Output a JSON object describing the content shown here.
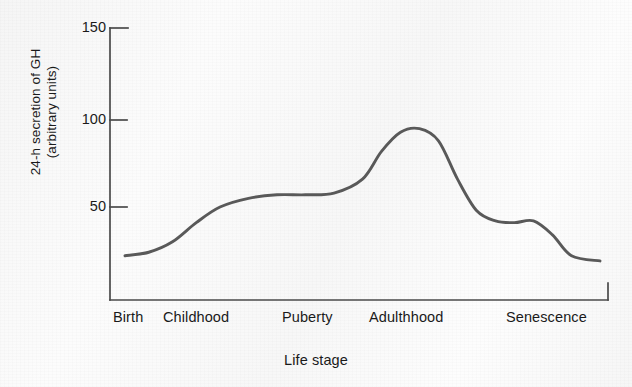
{
  "chart_data": {
    "type": "line",
    "title": "",
    "subtitle": "",
    "xlabel": "Life stage",
    "ylabel_lines": [
      "24-h secretion of GH",
      "(arbitrary units)"
    ],
    "ylabel": "24-h secretion of GH (arbitrary units)",
    "ylim": [
      0,
      150
    ],
    "yticks": [
      50,
      100,
      150
    ],
    "ytick_labels": [
      "50",
      "100",
      "150"
    ],
    "grid": false,
    "legend": "none",
    "categories": [
      "Birth",
      "Childhood",
      "Puberty",
      "Adulthhood",
      "Senescence"
    ],
    "series": [
      {
        "name": "24-h GH secretion",
        "color": "#595959",
        "x": [
          0.0,
          0.05,
          0.1,
          0.15,
          0.2,
          0.26,
          0.32,
          0.38,
          0.44,
          0.5,
          0.54,
          0.58,
          0.62,
          0.66,
          0.7,
          0.74,
          0.78,
          0.82,
          0.86,
          0.9,
          0.94,
          1.0
        ],
        "values": [
          22,
          24,
          30,
          41,
          50,
          55,
          57,
          57,
          58,
          66,
          82,
          93,
          95,
          88,
          66,
          48,
          42,
          41,
          42,
          34,
          22,
          19
        ]
      }
    ],
    "annotations": [
      {
        "label": "birth onset",
        "value": 22
      },
      {
        "label": "childhood plateau",
        "value": 57
      },
      {
        "label": "puberty peak",
        "value": 95
      },
      {
        "label": "adulthood plateau",
        "value": 42
      },
      {
        "label": "senescence trough",
        "value": 19
      }
    ],
    "axis_style": "open-frame-left-bottom"
  },
  "category_label_positions": [
    {
      "label": "Birth",
      "x": 113
    },
    {
      "label": "Childhood",
      "x": 163
    },
    {
      "label": "Puberty",
      "x": 282
    },
    {
      "label": "Adulthhood",
      "x": 369
    },
    {
      "label": "Senescence",
      "x": 506
    }
  ]
}
